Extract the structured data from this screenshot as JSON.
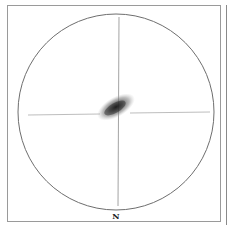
{
  "figure": {
    "type": "polar-projection-plot",
    "orientation_label": "N",
    "colors": {
      "frame": "#9a9a9a",
      "circle": "#6e6e6e",
      "crosshair": "#8c8c8c",
      "density_core": "#1a1a1a",
      "density_edge": "#bdbdbd"
    },
    "circle": {
      "cx": 116,
      "cy": 112,
      "r": 98
    },
    "crosshair": {
      "vertical": {
        "x1": 119,
        "y1": 17,
        "x2": 118,
        "y2": 206
      },
      "horizontal_left": {
        "x1": 28,
        "y1": 115,
        "x2": 100,
        "y2": 114
      },
      "horizontal_right": {
        "x1": 130,
        "y1": 113,
        "x2": 210,
        "y2": 112
      }
    },
    "density_cluster": {
      "cx": 116,
      "cy": 107,
      "rx": 20,
      "ry": 9,
      "rotation_deg": -30
    }
  }
}
